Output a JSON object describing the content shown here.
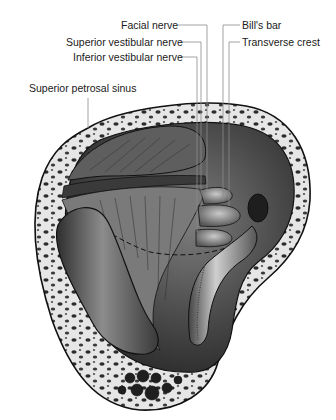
{
  "figure": {
    "labels": [
      {
        "id": "facial-nerve",
        "text": "Facial nerve"
      },
      {
        "id": "superior-vestibular-nerve",
        "text": "Superior vestibular nerve"
      },
      {
        "id": "inferior-vestibular-nerve",
        "text": "Inferior vestibular nerve"
      },
      {
        "id": "superior-petrosal-sinus",
        "text": "Superior petrosal sinus"
      },
      {
        "id": "bills-bar",
        "text": "Bill's bar"
      },
      {
        "id": "transverse-crest",
        "text": "Transverse crest"
      }
    ],
    "colors": {
      "outline": "#111111",
      "bone_light": "#e8e8e8",
      "bone_pore": "#2a2a2a",
      "cavity_dark": "#3c3c3c",
      "cavity_mid": "#7a7a7a",
      "highlight": "#d8d8d8",
      "leader_line": "#8a8a8a"
    }
  }
}
